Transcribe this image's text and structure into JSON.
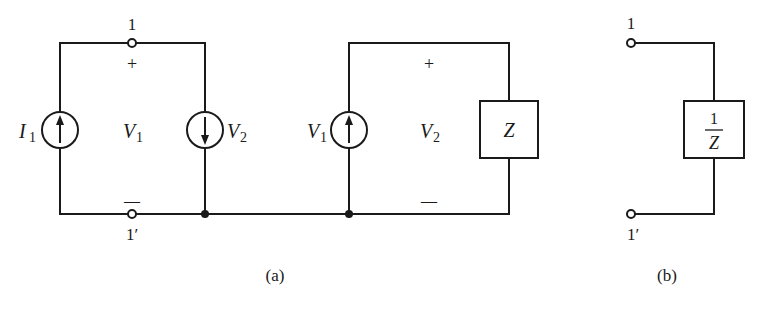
{
  "figure_a": {
    "caption": "(a)",
    "terminal_top": "1",
    "terminal_bottom": "1′",
    "plus": "+",
    "minus": "—",
    "source_i1": {
      "label": "I",
      "sub": "1",
      "arrow": "up"
    },
    "port_voltage": {
      "label": "V",
      "sub": "1"
    },
    "source_v2": {
      "label": "V",
      "sub": "2",
      "arrow": "down"
    },
    "source_v1": {
      "label": "V",
      "sub": "1",
      "arrow": "up"
    },
    "load_voltage": {
      "label": "V",
      "sub": "2"
    },
    "load_plus": "+",
    "load_minus": "—",
    "impedance": "Z"
  },
  "figure_b": {
    "caption": "(b)",
    "terminal_top": "1",
    "terminal_bottom": "1′",
    "admittance_num": "1",
    "admittance_den": "Z"
  },
  "colors": {
    "ink": "#1a1a1a",
    "background": "#ffffff"
  }
}
